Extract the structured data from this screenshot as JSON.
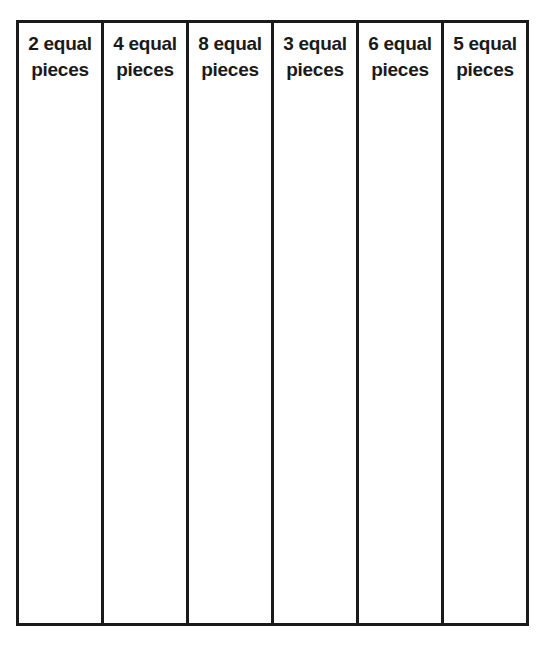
{
  "worksheet": {
    "columns": [
      {
        "line1": "2 equal",
        "line2": "pieces"
      },
      {
        "line1": "4 equal",
        "line2": "pieces"
      },
      {
        "line1": "8 equal",
        "line2": "pieces"
      },
      {
        "line1": "3 equal",
        "line2": "pieces"
      },
      {
        "line1": "6 equal",
        "line2": "pieces"
      },
      {
        "line1": "5 equal",
        "line2": "pieces"
      }
    ]
  }
}
